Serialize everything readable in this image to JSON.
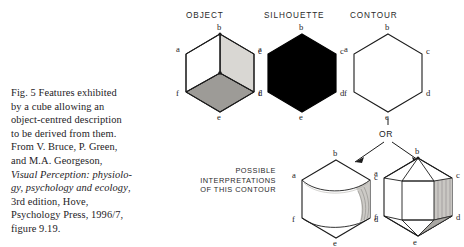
{
  "caption": {
    "lines": [
      {
        "text": "Fig. 5  Features exhibited",
        "italic": false
      },
      {
        "text": "by a cube allowing an",
        "italic": false
      },
      {
        "text": "object-centred description",
        "italic": false
      },
      {
        "text": "to be derived from them.",
        "italic": false
      },
      {
        "text": "From V. Bruce, P. Green,",
        "italic": false
      },
      {
        "text": "and M.A. Georgeson,",
        "italic": false
      },
      {
        "text": "Visual Perception: physiolo-",
        "italic": true
      },
      {
        "text": "gy, psychology and ecology",
        "italic": true
      },
      {
        "text": "3rd edition, Hove,",
        "italic": false
      },
      {
        "text": "Psychology Press, 1996/7,",
        "italic": false
      },
      {
        "text": "figure 9.19.",
        "italic": false
      }
    ]
  },
  "figure": {
    "headers": {
      "object": "OBJECT",
      "silhouette": "SILHOUETTE",
      "contour": "CONTOUR"
    },
    "or_label": "OR",
    "interpretations_label": {
      "line1": "POSSIBLE",
      "line2": "INTERPRETATIONS",
      "line3": "OF THIS CONTOUR"
    },
    "vertex_labels": {
      "a": "a",
      "b": "b",
      "c": "c",
      "d": "d",
      "e": "e",
      "f": "f"
    },
    "colors": {
      "ink": "#1c1c1c",
      "silhouette_fill": "#000000",
      "face_light": "#d8d6d2",
      "face_dark": "#9a9894",
      "face_white": "#ffffff",
      "paper": "#ffffff"
    }
  }
}
